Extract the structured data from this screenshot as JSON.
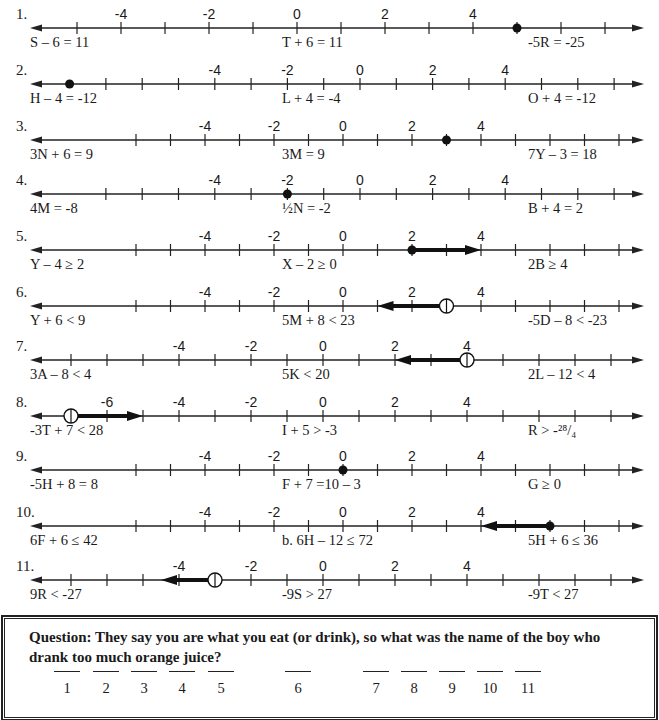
{
  "problems": [
    {
      "number": "1.",
      "eq_left": "S – 6 = 11",
      "eq_mid": "T + 6 = 11",
      "eq_right": "-5R = -25",
      "axis": {
        "zero_x": 297,
        "unit_px": 44,
        "tick_min": -5,
        "tick_max": 7,
        "labels": [
          -4,
          -2,
          0,
          2,
          4
        ]
      },
      "marks": [
        {
          "type": "closed",
          "at": 5
        }
      ]
    },
    {
      "number": "2.",
      "eq_left": "H – 4 = -12",
      "eq_mid": "L + 4 = -4",
      "eq_right": "O + 4 = -12",
      "axis": {
        "zero_x": 360,
        "unit_px": 36.3,
        "tick_min": -7,
        "tick_max": 7,
        "labels": [
          -4,
          -2,
          0,
          2,
          4
        ]
      },
      "marks": [
        {
          "type": "closed",
          "at": -8
        }
      ]
    },
    {
      "number": "3.",
      "eq_left": "3N + 6 = 9",
      "eq_mid": "3M = 9",
      "eq_right": "7Y – 3 = 18",
      "axis": {
        "zero_x": 343,
        "unit_px": 34.5,
        "tick_min": -6,
        "tick_max": 8,
        "labels": [
          -4,
          -2,
          0,
          2,
          4
        ]
      },
      "marks": [
        {
          "type": "closed",
          "at": 3
        }
      ]
    },
    {
      "number": "4.",
      "eq_left": "4M = -8",
      "eq_mid": "½N = -2",
      "eq_right": "B + 4 = 2",
      "axis": {
        "zero_x": 360,
        "unit_px": 36.3,
        "tick_min": -7,
        "tick_max": 7,
        "labels": [
          -4,
          -2,
          0,
          2,
          4
        ]
      },
      "marks": [
        {
          "type": "closed",
          "at": -2
        }
      ]
    },
    {
      "number": "5.",
      "eq_left": "Y – 4 ≥ 2",
      "eq_mid": "X – 2 ≥ 0",
      "eq_right": "2B ≥ 4",
      "axis": {
        "zero_x": 343,
        "unit_px": 34.5,
        "tick_min": -6,
        "tick_max": 8,
        "labels": [
          -4,
          -2,
          0,
          2,
          4
        ]
      },
      "marks": [
        {
          "type": "closed",
          "at": 2,
          "ray_to": 4
        }
      ]
    },
    {
      "number": "6.",
      "eq_left": "Y + 6 < 9",
      "eq_mid": "5M + 8 < 23",
      "eq_right": "-5D – 8 < -23",
      "axis": {
        "zero_x": 343,
        "unit_px": 34.5,
        "tick_min": -6,
        "tick_max": 8,
        "labels": [
          -4,
          -2,
          0,
          2,
          4
        ]
      },
      "marks": [
        {
          "type": "open",
          "at": 3,
          "ray_to": 1
        }
      ]
    },
    {
      "number": "7.",
      "eq_left": "3A – 8 < 4",
      "eq_mid": "5K < 20",
      "eq_right": "2L – 12 < 4",
      "axis": {
        "zero_x": 323,
        "unit_px": 36,
        "tick_min": -7,
        "tick_max": 8,
        "labels": [
          -4,
          -2,
          0,
          2,
          4
        ]
      },
      "marks": [
        {
          "type": "open",
          "at": 4,
          "ray_to": 2
        }
      ]
    },
    {
      "number": "8.",
      "eq_left": "-3T + 7 < 28",
      "eq_mid": "I + 5 > -3",
      "eq_right": "R > -²⁸/₄",
      "axis": {
        "zero_x": 323,
        "unit_px": 36,
        "tick_min": -7,
        "tick_max": 8,
        "labels": [
          -6,
          -4,
          -2,
          0,
          2,
          4
        ]
      },
      "marks": [
        {
          "type": "open",
          "at": -7,
          "ray_to": -5
        }
      ]
    },
    {
      "number": "9.",
      "eq_left": "-5H + 8 = 8",
      "eq_mid": "F + 7 =10 – 3",
      "eq_right": "G ≥ 0",
      "axis": {
        "zero_x": 343,
        "unit_px": 34.5,
        "tick_min": -6,
        "tick_max": 8,
        "labels": [
          -4,
          -2,
          0,
          2,
          4
        ]
      },
      "marks": [
        {
          "type": "closed",
          "at": 0
        }
      ]
    },
    {
      "number": "10.",
      "eq_left": "6F + 6 ≤ 42",
      "eq_mid": "b.  6H – 12 ≤ 72",
      "eq_right": "5H + 6 ≤ 36",
      "axis": {
        "zero_x": 343,
        "unit_px": 34.5,
        "tick_min": -6,
        "tick_max": 8,
        "labels": [
          -4,
          -2,
          0,
          2,
          4
        ]
      },
      "marks": [
        {
          "type": "closed",
          "at": 6,
          "ray_to": 4
        }
      ]
    },
    {
      "number": "11.",
      "eq_left": "9R < -27",
      "eq_mid": "-9S > 27",
      "eq_right": "-9T < 27",
      "axis": {
        "zero_x": 323,
        "unit_px": 36,
        "tick_min": -7,
        "tick_max": 8,
        "labels": [
          -4,
          -2,
          0,
          2,
          4
        ]
      },
      "marks": [
        {
          "type": "open",
          "at": -3,
          "ray_to": -4.5
        }
      ]
    }
  ],
  "question": {
    "text": "Question:  They say you are what you eat (or drink), so what was the name of the boy who drank too much orange juice?",
    "blanks": [
      "1",
      "2",
      "3",
      "4",
      "5",
      "6",
      "7",
      "8",
      "9",
      "10",
      "11"
    ]
  }
}
